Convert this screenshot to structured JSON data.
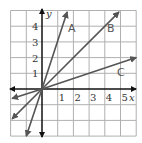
{
  "chart_data": {
    "type": "line",
    "title": "",
    "xlabel": "x",
    "ylabel": "y",
    "xlim": [
      -2,
      6
    ],
    "ylim": [
      -3,
      5
    ],
    "grid": true,
    "x_ticks": [
      "1",
      "2",
      "3",
      "4",
      "5"
    ],
    "y_ticks": [
      "1",
      "2",
      "3",
      "4"
    ],
    "series": [
      {
        "name": "A",
        "slope": 3,
        "points": [
          [
            -1,
            -3
          ],
          [
            0,
            0
          ],
          [
            1.6,
            4.9
          ]
        ],
        "label_pos": [
          1.9,
          3.9
        ]
      },
      {
        "name": "B",
        "slope": 1,
        "points": [
          [
            -1.9,
            -1.9
          ],
          [
            0,
            0
          ],
          [
            4.9,
            4.9
          ]
        ],
        "label_pos": [
          4.4,
          3.9
        ]
      },
      {
        "name": "C",
        "slope": 0.333,
        "points": [
          [
            -1.9,
            -0.6
          ],
          [
            0,
            0
          ],
          [
            6,
            2
          ]
        ],
        "label_pos": [
          5.1,
          1.0
        ]
      }
    ],
    "colors": {
      "lines": "#555555",
      "grid": "#b0b0b0",
      "axes": "#111111"
    }
  },
  "labels": {
    "x_axis": "x",
    "y_axis": "y",
    "x_ticks": [
      "1",
      "2",
      "3",
      "4",
      "5"
    ],
    "y_ticks": [
      "1",
      "2",
      "3",
      "4"
    ],
    "line_a": "A",
    "line_b": "B",
    "line_c": "C"
  }
}
